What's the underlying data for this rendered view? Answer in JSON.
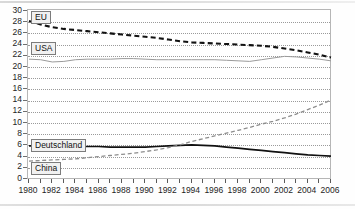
{
  "chart_data": {
    "type": "line",
    "title": "",
    "xlabel": "",
    "ylabel": "",
    "xlim": [
      1980,
      2006
    ],
    "ylim": [
      0,
      30
    ],
    "ytick_step": 2,
    "grid": true,
    "legend_position": "inline-callout",
    "x": [
      1980,
      1981,
      1982,
      1983,
      1984,
      1985,
      1986,
      1987,
      1988,
      1989,
      1990,
      1991,
      1992,
      1993,
      1994,
      1995,
      1996,
      1997,
      1998,
      1999,
      2000,
      2001,
      2002,
      2003,
      2004,
      2005,
      2006
    ],
    "ytick_labels": [
      "0",
      "2",
      "4",
      "6",
      "8",
      "10",
      "12",
      "14",
      "16",
      "18",
      "20",
      "22",
      "24",
      "26",
      "28",
      "30"
    ],
    "xtick_labels": [
      "1980",
      "1982",
      "1984",
      "1986",
      "1988",
      "1990",
      "1992",
      "1994",
      "1996",
      "1998",
      "2000",
      "2002",
      "2004",
      "2006"
    ],
    "series": [
      {
        "name": "EU",
        "style": "dashed-bold",
        "color": "#111111",
        "values": [
          28.2,
          27.6,
          27.1,
          26.8,
          26.6,
          26.4,
          26.2,
          26.0,
          25.8,
          25.6,
          25.4,
          25.2,
          24.9,
          24.6,
          24.4,
          24.3,
          24.2,
          24.1,
          24.0,
          23.9,
          23.8,
          23.6,
          23.3,
          23.0,
          22.6,
          22.2,
          21.7
        ]
      },
      {
        "name": "USA",
        "style": "solid-thin",
        "color": "#9a9a9a",
        "values": [
          21.4,
          21.3,
          20.9,
          21.0,
          21.3,
          21.4,
          21.4,
          21.4,
          21.5,
          21.5,
          21.4,
          21.3,
          21.3,
          21.3,
          21.3,
          21.3,
          21.3,
          21.2,
          21.1,
          21.0,
          21.3,
          21.6,
          21.9,
          21.8,
          21.6,
          21.4,
          21.1
        ]
      },
      {
        "name": "Deutschland",
        "style": "solid-bold",
        "color": "#111111",
        "values": [
          5.9,
          5.9,
          5.8,
          5.8,
          5.8,
          5.8,
          5.8,
          5.7,
          5.7,
          5.7,
          5.7,
          5.8,
          5.9,
          6.0,
          6.1,
          6.0,
          5.9,
          5.7,
          5.5,
          5.3,
          5.1,
          4.9,
          4.7,
          4.5,
          4.3,
          4.2,
          4.1
        ]
      },
      {
        "name": "China",
        "style": "dashed-thin",
        "color": "#8d8d8d",
        "values": [
          3.2,
          3.3,
          3.4,
          3.5,
          3.6,
          3.8,
          4.0,
          4.2,
          4.4,
          4.6,
          4.9,
          5.2,
          5.6,
          6.1,
          6.7,
          7.2,
          7.7,
          8.2,
          8.7,
          9.2,
          9.8,
          10.3,
          10.9,
          11.6,
          12.4,
          13.2,
          14.1
        ]
      }
    ]
  },
  "callouts": [
    {
      "label": "EU"
    },
    {
      "label": "USA"
    },
    {
      "label": "Deutschland"
    },
    {
      "label": "China"
    }
  ]
}
